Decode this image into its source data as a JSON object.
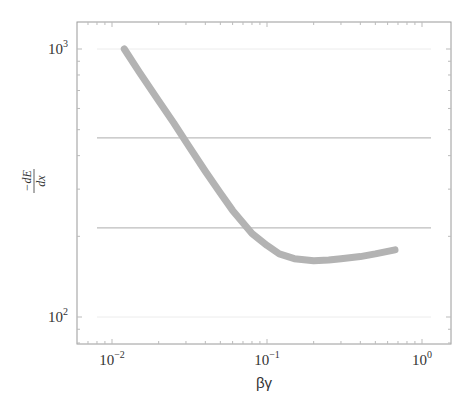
{
  "chart_data": {
    "type": "line",
    "title": "",
    "xlabel": "βγ",
    "ylabel": "-dE/dx",
    "xscale": "log",
    "yscale": "log",
    "xlim": [
      0.0067,
      1.4
    ],
    "ylim": [
      78,
      1300
    ],
    "xticks": [
      {
        "base": "10",
        "exp": "−2",
        "value": 0.01
      },
      {
        "base": "10",
        "exp": "−1",
        "value": 0.1
      },
      {
        "base": "10",
        "exp": "0",
        "value": 1
      }
    ],
    "yticks": [
      {
        "base": "10",
        "exp": "3",
        "value": 1000
      },
      {
        "base": "10",
        "exp": "2",
        "value": 100
      }
    ],
    "grid": {
      "y_gridlines_at": [
        100,
        1000
      ],
      "style": "faint"
    },
    "series": [
      {
        "name": "dE/dx curve",
        "color": "#b3b3b3",
        "x": [
          0.012,
          0.015,
          0.02,
          0.025,
          0.03,
          0.04,
          0.05,
          0.06,
          0.08,
          0.1,
          0.12,
          0.15,
          0.2,
          0.25,
          0.3,
          0.4,
          0.5,
          0.67
        ],
        "y": [
          1000,
          820,
          640,
          530,
          450,
          350,
          290,
          250,
          205,
          185,
          172,
          165,
          162,
          163,
          165,
          168,
          172,
          178
        ]
      }
    ],
    "reference_lines": [
      {
        "orientation": "horizontal",
        "y": 466,
        "color": "#bdbdbd",
        "x_range": [
          0.01,
          1.0
        ]
      },
      {
        "orientation": "horizontal",
        "y": 215,
        "color": "#bdbdbd",
        "x_range": [
          0.01,
          1.0
        ]
      }
    ]
  },
  "labels": {
    "x_axis": "βγ",
    "y_axis_num": "dE",
    "y_axis_den": "dx",
    "y_axis_minus": "−"
  }
}
